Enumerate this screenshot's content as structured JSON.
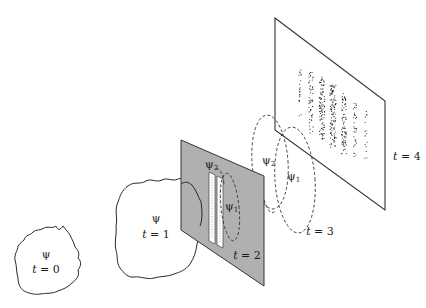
{
  "figure": {
    "stages": [
      {
        "id": "t0",
        "psi_label": "ψ",
        "time_label": "t = 0",
        "t_var": "t",
        "t_val": "0"
      },
      {
        "id": "t1",
        "psi_label": "ψ",
        "time_label": "t = 1",
        "t_var": "t",
        "t_val": "1"
      },
      {
        "id": "t2",
        "time_label": "t = 2",
        "t_var": "t",
        "t_val": "2",
        "slit_labels": [
          {
            "psi": "ψ",
            "sub": "2"
          },
          {
            "psi": "ψ",
            "sub": "1"
          }
        ]
      },
      {
        "id": "t3",
        "time_label": "t = 3",
        "t_var": "t",
        "t_val": "3",
        "wave_labels": [
          {
            "psi": "ψ",
            "sub": "2"
          },
          {
            "psi": "ψ",
            "sub": "1"
          }
        ]
      },
      {
        "id": "t4",
        "time_label": "t = 4",
        "t_var": "t",
        "t_val": "4",
        "pattern": "interference fringes (dot bands)"
      }
    ],
    "colors": {
      "barrier_fill": "#b0b0b0",
      "line": "#2a2a2a",
      "background": "#ffffff"
    },
    "fringe_bands": 7
  }
}
